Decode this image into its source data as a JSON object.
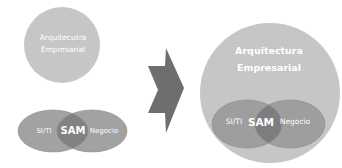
{
  "diagram": {
    "before": {
      "top_circle": {
        "line1": "Arquitecutra",
        "line2": "Empresarial"
      },
      "venn": {
        "left": "SI/TI",
        "center": "SAM",
        "right": "Negocio"
      }
    },
    "arrow": {
      "direction": "right"
    },
    "after": {
      "outer_circle": {
        "line1": "Arquitectura",
        "line2": "Empresarial"
      },
      "venn": {
        "left": "SI/TI",
        "center": "SAM",
        "right": "Negocio"
      }
    },
    "colors": {
      "light_circle": "#c4c4c4",
      "ellipse": "#9a9a9a",
      "overlap": "#7c7c7c",
      "arrow": "#6e6e6e",
      "text": "#ffffff"
    }
  }
}
